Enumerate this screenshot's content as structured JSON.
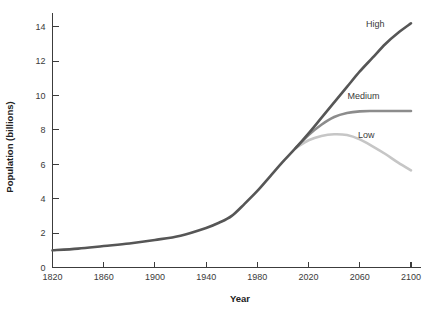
{
  "chart_data": {
    "type": "line",
    "title": "",
    "xlabel": "Year",
    "ylabel": "Population (billions)",
    "xlim": [
      1820,
      2100
    ],
    "ylim": [
      0,
      14.8
    ],
    "grid": false,
    "legend_position": "inline-right",
    "xticks": [
      1820,
      1860,
      1900,
      1940,
      1980,
      2020,
      2060,
      2100
    ],
    "xtick_labels": [
      "1820",
      "1860",
      "1900",
      "1940",
      "1980",
      "2020",
      "2060",
      "2100"
    ],
    "yticks": [
      0,
      2,
      4,
      6,
      8,
      10,
      12,
      14
    ],
    "ytick_labels": [
      "0",
      "2",
      "4",
      "6",
      "8",
      "10",
      "12",
      "14"
    ],
    "series": [
      {
        "name": "High",
        "label": "High",
        "color": "#565656",
        "width": 2.6,
        "x": [
          1820,
          1840,
          1860,
          1880,
          1900,
          1920,
          1940,
          1950,
          1960,
          1970,
          1980,
          1990,
          2000,
          2010,
          2020,
          2030,
          2040,
          2050,
          2060,
          2070,
          2080,
          2090,
          2100
        ],
        "values": [
          1.0,
          1.1,
          1.25,
          1.4,
          1.6,
          1.85,
          2.3,
          2.6,
          3.0,
          3.7,
          4.45,
          5.3,
          6.15,
          6.95,
          7.8,
          8.7,
          9.6,
          10.5,
          11.4,
          12.2,
          13.0,
          13.65,
          14.2
        ]
      },
      {
        "name": "Medium",
        "label": "Medium",
        "color": "#8c8c8c",
        "width": 2.6,
        "x": [
          2010,
          2020,
          2030,
          2040,
          2050,
          2060,
          2070,
          2080,
          2090,
          2100
        ],
        "values": [
          6.95,
          7.7,
          8.3,
          8.75,
          8.98,
          9.08,
          9.1,
          9.1,
          9.1,
          9.1
        ]
      },
      {
        "name": "Low",
        "label": "Low",
        "color": "#c6c6c6",
        "width": 2.6,
        "x": [
          2010,
          2020,
          2030,
          2040,
          2050,
          2060,
          2070,
          2080,
          2090,
          2100
        ],
        "values": [
          6.95,
          7.4,
          7.65,
          7.75,
          7.7,
          7.45,
          7.05,
          6.6,
          6.1,
          5.65
        ]
      }
    ],
    "annotations": [
      {
        "text": "High",
        "x": 2072,
        "y": 14.0
      },
      {
        "text": "Medium",
        "x": 2063,
        "y": 9.8
      },
      {
        "text": "Low",
        "x": 2065,
        "y": 7.55
      }
    ]
  }
}
